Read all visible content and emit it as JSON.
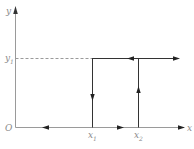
{
  "diagram": {
    "labels": {
      "y_axis": "y",
      "x_axis": "x",
      "origin": "O",
      "y1": "y",
      "y1_sub": "1",
      "x1": "x",
      "x1_sub": "1",
      "x2": "x",
      "x2_sub": "2"
    },
    "colors": {
      "axis": "#9a9a9a",
      "path": "#333333",
      "dashed": "#9a9a9a",
      "arrow": "#222222",
      "label": "#8a8a8a"
    },
    "arrows": [
      {
        "segment": "top-line",
        "direction": "left"
      },
      {
        "segment": "top-line",
        "direction": "right"
      },
      {
        "segment": "x1-vertical",
        "direction": "down"
      },
      {
        "segment": "x2-vertical",
        "direction": "up"
      },
      {
        "segment": "x-axis-left",
        "direction": "left"
      },
      {
        "segment": "x-axis-middle",
        "direction": "right"
      },
      {
        "segment": "x-axis-right",
        "direction": "right"
      }
    ]
  }
}
